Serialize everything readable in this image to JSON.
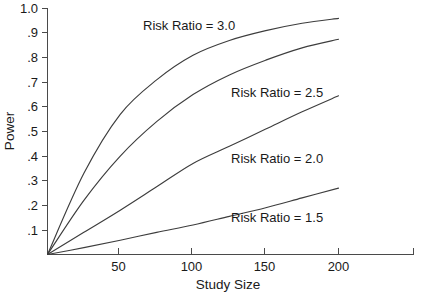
{
  "chart_data": {
    "type": "line",
    "title": "",
    "xlabel": "Study Size",
    "ylabel": "Power",
    "xlim": [
      0,
      250
    ],
    "ylim": [
      0.0,
      1.0
    ],
    "grid": false,
    "legend_position": "inline-annotations",
    "x_ticks": [
      50,
      100,
      150,
      200
    ],
    "x_tick_labels": [
      "50",
      "100",
      "150",
      "200"
    ],
    "y_ticks": [
      0.1,
      0.2,
      0.3,
      0.4,
      0.5,
      0.6,
      0.7,
      0.8,
      0.9,
      1.0
    ],
    "y_tick_labels": [
      ".1",
      ".2",
      ".3",
      ".4",
      ".5",
      ".6",
      ".7",
      ".8",
      ".9",
      "1.0"
    ],
    "x": [
      0,
      25,
      50,
      75,
      100,
      125,
      150,
      175,
      200
    ],
    "series": [
      {
        "name": "Risk Ratio = 3.0",
        "label": "Risk Ratio = 3.0",
        "values": [
          0.0,
          0.33,
          0.57,
          0.71,
          0.81,
          0.87,
          0.91,
          0.94,
          0.96
        ]
      },
      {
        "name": "Risk Ratio = 2.5",
        "label": "Risk Ratio = 2.5",
        "values": [
          0.0,
          0.22,
          0.4,
          0.54,
          0.65,
          0.73,
          0.79,
          0.84,
          0.875
        ]
      },
      {
        "name": "Risk Ratio = 2.0",
        "label": "Risk Ratio = 2.0",
        "values": [
          0.0,
          0.09,
          0.18,
          0.275,
          0.37,
          0.44,
          0.51,
          0.58,
          0.645
        ]
      },
      {
        "name": "Risk Ratio = 1.5",
        "label": "Risk Ratio = 1.5",
        "values": [
          0.0,
          0.028,
          0.058,
          0.09,
          0.12,
          0.155,
          0.19,
          0.23,
          0.27
        ]
      }
    ],
    "annotations": [
      {
        "text": "Risk Ratio = 3.0",
        "x_px": 143,
        "y_px": 30
      },
      {
        "text": "Risk Ratio = 2.5",
        "x_px": 231,
        "y_px": 97
      },
      {
        "text": "Risk Ratio = 2.0",
        "x_px": 231,
        "y_px": 163
      },
      {
        "text": "Risk Ratio = 1.5",
        "x_px": 231,
        "y_px": 222
      }
    ],
    "colors": {
      "background": "#ffffff",
      "axis": "#4a4a4a",
      "curve": "#3d3d3d",
      "text": "#1a1a1a"
    }
  }
}
